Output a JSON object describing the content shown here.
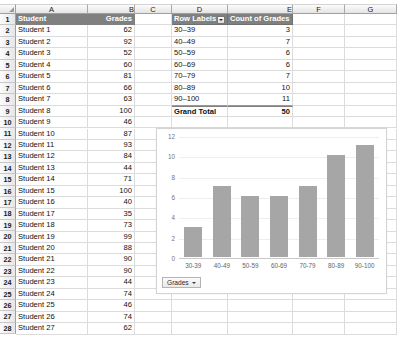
{
  "spreadsheet": {
    "column_headers": [
      "A",
      "B",
      "C",
      "D",
      "E",
      "F",
      "G"
    ],
    "row_headers": [
      "1",
      "2",
      "3",
      "4",
      "5",
      "6",
      "7",
      "8",
      "9",
      "10",
      "11",
      "12",
      "13",
      "14",
      "15",
      "16",
      "17",
      "18",
      "19",
      "20",
      "21",
      "22",
      "23",
      "24",
      "25",
      "26",
      "27",
      "28"
    ],
    "corner_icon": "select-all-icon"
  },
  "data_table": {
    "header": {
      "student": "Student",
      "grades": "Grades"
    },
    "rows": [
      {
        "student": "Student 1",
        "grade": "62"
      },
      {
        "student": "Student 2",
        "grade": "92"
      },
      {
        "student": "Student 3",
        "grade": "52"
      },
      {
        "student": "Student 4",
        "grade": "60"
      },
      {
        "student": "Student 5",
        "grade": "81"
      },
      {
        "student": "Student 6",
        "grade": "66"
      },
      {
        "student": "Student 7",
        "grade": "63"
      },
      {
        "student": "Student 8",
        "grade": "100"
      },
      {
        "student": "Student 9",
        "grade": "46"
      },
      {
        "student": "Student 10",
        "grade": "87"
      },
      {
        "student": "Student 11",
        "grade": "93"
      },
      {
        "student": "Student 12",
        "grade": "84"
      },
      {
        "student": "Student 13",
        "grade": "44"
      },
      {
        "student": "Student 14",
        "grade": "71"
      },
      {
        "student": "Student 15",
        "grade": "100"
      },
      {
        "student": "Student 16",
        "grade": "40"
      },
      {
        "student": "Student 17",
        "grade": "35"
      },
      {
        "student": "Student 18",
        "grade": "73"
      },
      {
        "student": "Student 19",
        "grade": "99"
      },
      {
        "student": "Student 20",
        "grade": "88"
      },
      {
        "student": "Student 21",
        "grade": "90"
      },
      {
        "student": "Student 22",
        "grade": "90"
      },
      {
        "student": "Student 23",
        "grade": "44"
      },
      {
        "student": "Student 24",
        "grade": "74"
      },
      {
        "student": "Student 25",
        "grade": "46"
      },
      {
        "student": "Student 26",
        "grade": "74"
      },
      {
        "student": "Student 27",
        "grade": "62"
      }
    ]
  },
  "pivot_table": {
    "row_labels_header": "Row Labels",
    "value_header": "Count of Grades",
    "filter_icon": "filter-dropdown-icon",
    "rows": [
      {
        "label": "30–39",
        "count": "3"
      },
      {
        "label": "40–49",
        "count": "7"
      },
      {
        "label": "50–59",
        "count": "6"
      },
      {
        "label": "60–69",
        "count": "6"
      },
      {
        "label": "70–79",
        "count": "7"
      },
      {
        "label": "80–89",
        "count": "10"
      },
      {
        "label": "90–100",
        "count": "11"
      }
    ],
    "grand_total_label": "Grand Total",
    "grand_total_value": "50"
  },
  "chart_data": {
    "type": "bar",
    "title": "",
    "xlabel": "",
    "ylabel": "",
    "categories": [
      "30-39",
      "40-49",
      "50-59",
      "60-69",
      "70-79",
      "80-89",
      "90-100"
    ],
    "values": [
      3,
      7,
      6,
      6,
      7,
      10,
      11
    ],
    "series": [
      {
        "name": "Count of Grades",
        "values": [
          3,
          7,
          6,
          6,
          7,
          10,
          11
        ]
      }
    ],
    "ylim": [
      0,
      12
    ],
    "yticks": [
      "12",
      "10",
      "8",
      "6",
      "4",
      "2",
      "0"
    ],
    "grid": true,
    "legend_position": "bottom-left",
    "bar_color": "#a6a6a6",
    "field_button_label": "Grades"
  }
}
